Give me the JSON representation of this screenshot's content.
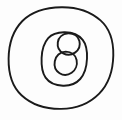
{
  "figure": {
    "style": "hand-drawn ink line art",
    "background_color": "#fdfdfd",
    "stroke_color": "#1a1a1a",
    "canvas": {
      "width": 122,
      "height": 120
    },
    "shapes": [
      {
        "name": "outer-circle",
        "type": "circle",
        "cx": 61,
        "cy": 58,
        "rx": 52,
        "ry": 51,
        "stroke_width": 1.9,
        "label": "outer circle"
      },
      {
        "name": "middle-circle",
        "type": "circle",
        "cx": 64,
        "cy": 58,
        "rx": 22,
        "ry": 26,
        "stroke_width": 1.9,
        "label": "middle circle"
      },
      {
        "name": "figure-eight-upper-lobe",
        "type": "circle",
        "cx": 68,
        "cy": 44,
        "rx": 11,
        "ry": 11,
        "stroke_width": 1.9,
        "label": "upper small circle"
      },
      {
        "name": "figure-eight-lower-lobe",
        "type": "circle",
        "cx": 66,
        "cy": 63,
        "rx": 10,
        "ry": 11,
        "stroke_width": 1.9,
        "label": "lower small circle"
      }
    ]
  }
}
